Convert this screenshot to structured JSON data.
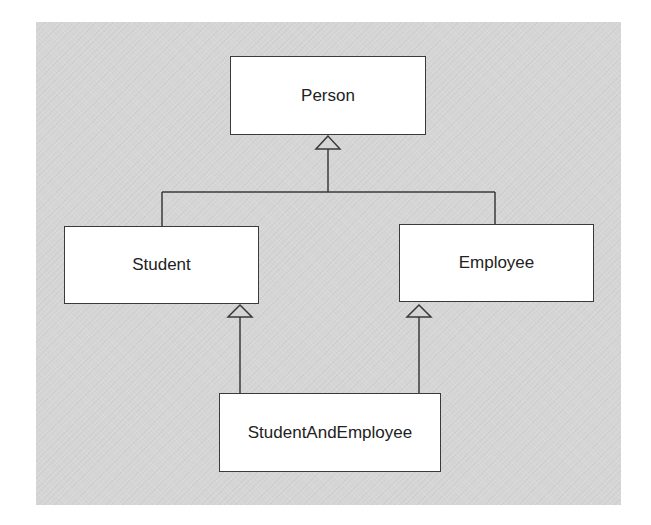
{
  "diagram": {
    "type": "uml-class-inheritance",
    "background_color": "#d5d5d5",
    "line_color": "#3a3a3a",
    "classes": [
      {
        "id": "person",
        "label": "Person"
      },
      {
        "id": "student",
        "label": "Student"
      },
      {
        "id": "employee",
        "label": "Employee"
      },
      {
        "id": "student_and_employee",
        "label": "StudentAndEmployee"
      }
    ],
    "relationships": [
      {
        "type": "generalization",
        "from": "Student",
        "to": "Person"
      },
      {
        "type": "generalization",
        "from": "Employee",
        "to": "Person"
      },
      {
        "type": "generalization",
        "from": "StudentAndEmployee",
        "to": "Student"
      },
      {
        "type": "generalization",
        "from": "StudentAndEmployee",
        "to": "Employee"
      }
    ]
  }
}
